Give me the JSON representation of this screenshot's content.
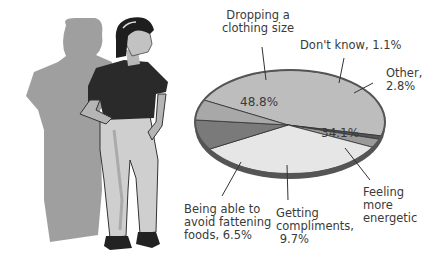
{
  "chart_data": {
    "type": "pie",
    "title": "",
    "slices": [
      {
        "label": "Dropping a clothing size",
        "value": 48.8,
        "color": "#bdbdbd"
      },
      {
        "label": "Don't know",
        "value": 1.1,
        "color": "#555555"
      },
      {
        "label": "Other",
        "value": 2.8,
        "color": "#9a9a9a"
      },
      {
        "label": "Feeling more energetic",
        "value": 34.1,
        "color": "#e6e6e6"
      },
      {
        "label": "Getting compliments",
        "value": 9.7,
        "color": "#7a7a7a"
      },
      {
        "label": "Being able to avoid fattening foods",
        "value": 6.5,
        "color": "#a8a8a8"
      }
    ],
    "annotations": {
      "dropping": "Dropping a\nclothing size",
      "dropping_pct": "48.8%",
      "dontknow": "Don't know, 1.1%",
      "other": "Other,\n2.8%",
      "energetic": "Feeling\nmore\nenergetic",
      "energetic_pct": "34.1%",
      "compliments": "Getting\ncompliments,\n 9.7%",
      "avoid": "Being able to\navoid fattening\nfoods, 6.5%"
    },
    "legend": "none (direct labels with leader lines)"
  },
  "illustration": {
    "description": "woman in dark t-shirt and light trousers, hands on hips, with larger grey shadow silhouette behind"
  }
}
